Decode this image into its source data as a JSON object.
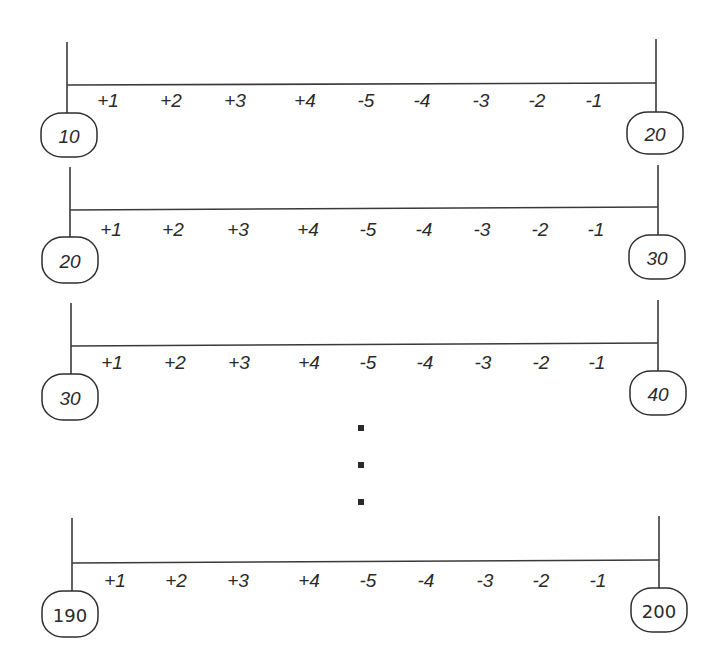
{
  "diagram": {
    "type": "number-line-segments",
    "tick_labels": [
      "+1",
      "+2",
      "+3",
      "+4",
      "-5",
      "-4",
      "-3",
      "-2",
      "-1"
    ],
    "rows": [
      {
        "start_label": "10",
        "end_label": "20",
        "label_style": "italic",
        "geom": {
          "left_x": 67,
          "right_x": 656,
          "line_y_left": 85,
          "line_y_right": 83,
          "vert_top_left": 42,
          "vert_top_right": 39,
          "left_oval": {
            "cx": 69,
            "cy": 135,
            "rx": 28,
            "ry": 22
          },
          "right_oval": {
            "cx": 655,
            "cy": 133,
            "rx": 28,
            "ry": 21
          },
          "tick_x": [
            108,
            171,
            235,
            305,
            366,
            422,
            481,
            537,
            594
          ],
          "tick_y": 100
        }
      },
      {
        "start_label": "20",
        "end_label": "30",
        "label_style": "italic",
        "geom": {
          "left_x": 70,
          "right_x": 658,
          "line_y_left": 210,
          "line_y_right": 207,
          "vert_top_left": 167,
          "vert_top_right": 165,
          "left_oval": {
            "cx": 70,
            "cy": 260,
            "rx": 28,
            "ry": 23
          },
          "right_oval": {
            "cx": 657,
            "cy": 257,
            "rx": 28,
            "ry": 22
          },
          "tick_x": [
            111,
            173,
            238,
            308,
            368,
            424,
            482,
            540,
            596
          ],
          "tick_y": 229
        }
      },
      {
        "start_label": "30",
        "end_label": "40",
        "label_style": "italic",
        "geom": {
          "left_x": 71,
          "right_x": 658,
          "line_y_left": 346,
          "line_y_right": 343,
          "vert_top_left": 303,
          "vert_top_right": 300,
          "left_oval": {
            "cx": 70,
            "cy": 397,
            "rx": 28,
            "ry": 23
          },
          "right_oval": {
            "cx": 658,
            "cy": 393,
            "rx": 28,
            "ry": 22
          },
          "tick_x": [
            112,
            175,
            239,
            309,
            368,
            425,
            483,
            541,
            597
          ],
          "tick_y": 362
        }
      },
      {
        "start_label": "190",
        "end_label": "200",
        "label_style": "upright",
        "geom": {
          "left_x": 72,
          "right_x": 659,
          "line_y_left": 563,
          "line_y_right": 560,
          "vert_top_left": 518,
          "vert_top_right": 516,
          "left_oval": {
            "cx": 70,
            "cy": 614,
            "rx": 28,
            "ry": 23
          },
          "right_oval": {
            "cx": 659,
            "cy": 610,
            "rx": 28,
            "ry": 22
          },
          "tick_x": [
            115,
            176,
            238,
            309,
            368,
            426,
            485,
            541,
            598
          ],
          "tick_y": 580
        }
      }
    ],
    "ellipsis": {
      "symbol": "vertical-ellipsis",
      "dots": [
        {
          "cx": 361,
          "cy": 428
        },
        {
          "cx": 361,
          "cy": 465
        },
        {
          "cx": 361,
          "cy": 502
        }
      ],
      "size": 6
    },
    "colors": {
      "stroke": "#3a3a3a",
      "text": "#2a2a2a",
      "background": "#ffffff"
    }
  }
}
